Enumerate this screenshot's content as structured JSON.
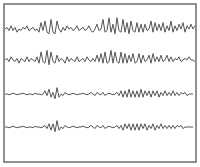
{
  "chart_data": {
    "type": "line",
    "title": "",
    "xlabel": "",
    "ylabel": "",
    "grid": false,
    "legend": null,
    "frame": {
      "x": 4,
      "y": 4,
      "width": 192,
      "height": 158,
      "stroke": "#555555"
    },
    "line_color": "#555555",
    "x": {
      "start": 5,
      "end": 195,
      "step": 2
    },
    "series": [
      {
        "name": "trace-1",
        "baseline": 29,
        "values": [
          0,
          -1,
          1,
          -2,
          1,
          -1,
          2,
          0,
          1,
          -1,
          0,
          -2,
          1,
          0,
          -1,
          1,
          0,
          2,
          -4,
          1,
          -5,
          2,
          3,
          -6,
          2,
          3,
          -5,
          0,
          2,
          -1,
          1,
          -2,
          0,
          -1,
          1,
          0,
          -2,
          1,
          0,
          -1,
          1,
          0,
          -2,
          1,
          2,
          0,
          -3,
          1,
          0,
          -6,
          2,
          1,
          -7,
          2,
          -3,
          3,
          -7,
          1,
          2,
          -6,
          2,
          -4,
          3,
          -5,
          1,
          2,
          -4,
          2,
          -3,
          2,
          -3,
          1,
          0,
          -5,
          2,
          -4,
          1,
          -3,
          1,
          -4,
          2,
          -2,
          1,
          -5,
          2,
          -2,
          1,
          -3,
          0,
          -4,
          2,
          -2,
          0,
          -3,
          0,
          -2,
          1
        ]
      },
      {
        "name": "trace-2",
        "baseline": 60,
        "values": [
          0,
          -1,
          1,
          -2,
          0,
          1,
          -1,
          2,
          -1,
          0,
          1,
          -2,
          1,
          -1,
          0,
          1,
          -2,
          2,
          -5,
          1,
          2,
          -6,
          3,
          -5,
          1,
          2,
          -3,
          1,
          -1,
          0,
          2,
          -2,
          1,
          -1,
          0,
          1,
          -2,
          1,
          0,
          -1,
          1,
          -2,
          0,
          1,
          -1,
          1,
          -3,
          1,
          -4,
          2,
          -5,
          2,
          1,
          -6,
          2,
          -5,
          1,
          2,
          -5,
          2,
          -4,
          2,
          -3,
          1,
          -4,
          2,
          1,
          -4,
          2,
          -3,
          1,
          0,
          -3,
          2,
          -4,
          1,
          -2,
          1,
          -3,
          1,
          0,
          -3,
          1,
          -2,
          1,
          -1,
          0,
          -2,
          1,
          0,
          -1,
          0,
          -2,
          0,
          0,
          1
        ]
      },
      {
        "name": "trace-3",
        "baseline": 94,
        "values": [
          0,
          0,
          0.5,
          0,
          -0.5,
          0,
          0.5,
          0,
          0,
          -0.5,
          0,
          0.5,
          0,
          0,
          0.5,
          -0.5,
          0,
          0,
          0.5,
          0,
          -2,
          1,
          -3,
          2,
          -1,
          3,
          -4,
          2,
          0,
          1,
          -1,
          0,
          0.5,
          0,
          -0.5,
          0,
          0.5,
          0,
          0,
          -0.5,
          0,
          0.5,
          0,
          -1,
          0,
          1,
          -1,
          0,
          0.5,
          -1,
          1,
          0,
          -0.5,
          0,
          0.5,
          0,
          -1,
          1,
          -2,
          2,
          -2,
          2,
          -3,
          2,
          -2,
          2,
          -2,
          2,
          -3,
          2,
          -2,
          1,
          -2,
          2,
          -2,
          1,
          -2,
          2,
          -1,
          1,
          -2,
          1,
          -1,
          1,
          -2,
          1,
          -1,
          1,
          -1,
          0,
          -1,
          1,
          0,
          0,
          0
        ]
      },
      {
        "name": "trace-4",
        "baseline": 127,
        "values": [
          0,
          0,
          0.5,
          0,
          -0.5,
          0,
          0.5,
          0,
          0,
          -0.5,
          0,
          0.5,
          0,
          0,
          0.5,
          -0.5,
          0,
          0,
          0.5,
          0,
          -1,
          1,
          -2,
          2,
          -2,
          3,
          -4,
          2,
          0,
          1,
          -1,
          0,
          0.5,
          0,
          -0.5,
          0,
          0.5,
          0,
          0,
          -0.5,
          0,
          0.5,
          0,
          -1,
          0,
          1,
          -1,
          0,
          0.5,
          -1,
          1,
          0,
          -0.5,
          0,
          0.5,
          0,
          -1,
          1,
          -1,
          2,
          -2,
          1,
          -2,
          2,
          -2,
          2,
          -2,
          2,
          -2,
          1,
          -2,
          2,
          -1,
          1,
          -2,
          2,
          -1,
          1,
          -2,
          1,
          -1,
          1,
          -1,
          1,
          -1,
          1,
          -1,
          0,
          -1,
          1,
          0,
          0,
          0,
          0,
          0
        ]
      }
    ]
  }
}
